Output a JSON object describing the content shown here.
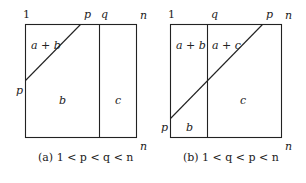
{
  "panels": [
    {
      "id": "a",
      "top_labels": {
        "left": "1",
        "p": "p",
        "q": "q",
        "right": "n"
      },
      "left_label": "p",
      "bottom_right_label": "n",
      "regions": {
        "top_left": "a + b",
        "middle": "b",
        "right": "c"
      },
      "caption": "(a) 1 < p < q < n"
    },
    {
      "id": "b",
      "top_labels": {
        "left": "1",
        "q": "q",
        "p": "p",
        "right": "n"
      },
      "left_label": "p",
      "bottom_right_label": "n",
      "regions": {
        "top_left": "a + b",
        "top_mid": "a + c",
        "bottom_left": "b",
        "right": "c"
      },
      "caption": "(b) 1 < q < p < n"
    }
  ]
}
